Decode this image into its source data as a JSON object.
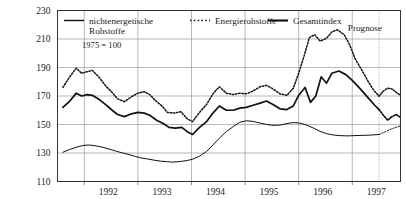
{
  "chart_data": {
    "type": "line",
    "title": "",
    "subtitle": "",
    "note": "1975 = 100",
    "xlabel": "",
    "ylabel": "",
    "ylim": [
      110,
      230
    ],
    "yticks": [
      110,
      130,
      150,
      170,
      190,
      210,
      230
    ],
    "xlim": [
      1991.5,
      1997.9
    ],
    "xticks": [
      1992,
      1993,
      1994,
      1995,
      1996,
      1997
    ],
    "xtick_labels": [
      "1992",
      "1993",
      "1994",
      "1995",
      "1996",
      "1997"
    ],
    "grid": true,
    "legend_position": "top",
    "forecast_label": "Prognose",
    "forecast_start_x": 1997.5,
    "legend": [
      {
        "label": "nichtenergetische Rohstoffe",
        "style": "solid-thin",
        "key": "nichtenergetische"
      },
      {
        "label": "Energierohstoffe",
        "style": "dotted",
        "key": "energie"
      },
      {
        "label": "Gesamtindex",
        "style": "solid-thick",
        "key": "gesamt"
      }
    ],
    "series": [
      {
        "name": "nichtenergetische Rohstoffe",
        "style": "solid-thin",
        "x": [
          1991.6,
          1991.75,
          1991.9,
          1992.0,
          1992.1,
          1992.22,
          1992.35,
          1992.48,
          1992.6,
          1992.72,
          1992.85,
          1992.95,
          1993.05,
          1993.18,
          1993.3,
          1993.42,
          1993.55,
          1993.65,
          1993.78,
          1993.9,
          1994.02,
          1994.15,
          1994.28,
          1994.4,
          1994.52,
          1994.65,
          1994.78,
          1994.9,
          1995.02,
          1995.15,
          1995.28,
          1995.4,
          1995.52,
          1995.65,
          1995.78,
          1995.9,
          1996.02,
          1996.15,
          1996.28,
          1996.4,
          1996.52,
          1996.65,
          1996.78,
          1996.9,
          1997.05,
          1997.2,
          1997.35,
          1997.5
        ],
        "y": [
          130.5,
          132.8,
          134.6,
          135.4,
          135.6,
          135.0,
          134.0,
          132.6,
          131.2,
          130.0,
          128.8,
          127.6,
          126.6,
          125.8,
          125.0,
          124.3,
          123.9,
          123.6,
          124.0,
          124.6,
          125.6,
          127.8,
          131.0,
          135.6,
          140.4,
          145.0,
          148.6,
          151.6,
          152.6,
          152.2,
          151.0,
          150.0,
          149.4,
          149.6,
          150.6,
          151.4,
          151.0,
          149.6,
          147.4,
          145.2,
          143.6,
          142.6,
          142.2,
          142.0,
          142.2,
          142.4,
          142.6,
          143.0
        ],
        "forecast_x": [
          1997.5,
          1997.6,
          1997.7,
          1997.8,
          1997.9
        ],
        "forecast_y": [
          143.0,
          144.6,
          146.4,
          147.8,
          149.0
        ]
      },
      {
        "name": "Energierohstoffe",
        "style": "dotted",
        "x": [
          1991.6,
          1991.72,
          1991.85,
          1991.95,
          1992.05,
          1992.15,
          1992.28,
          1992.4,
          1992.52,
          1992.62,
          1992.75,
          1992.88,
          1993.0,
          1993.12,
          1993.22,
          1993.32,
          1993.45,
          1993.55,
          1993.68,
          1993.8,
          1993.92,
          1994.02,
          1994.15,
          1994.28,
          1994.4,
          1994.52,
          1994.65,
          1994.78,
          1994.9,
          1995.02,
          1995.15,
          1995.28,
          1995.4,
          1995.52,
          1995.65,
          1995.78,
          1995.9,
          1996.0,
          1996.1,
          1996.2,
          1996.3,
          1996.4,
          1996.52,
          1996.62,
          1996.72,
          1996.85,
          1996.95,
          1997.05,
          1997.18,
          1997.3,
          1997.4,
          1997.5
        ],
        "y": [
          176.0,
          183.0,
          189.5,
          186.0,
          187.0,
          188.0,
          183.0,
          177.0,
          172.5,
          168.0,
          166.0,
          169.5,
          172.0,
          173.0,
          171.0,
          167.0,
          163.0,
          158.5,
          158.0,
          159.0,
          154.0,
          152.0,
          158.5,
          164.0,
          171.5,
          176.5,
          172.0,
          171.0,
          172.0,
          171.5,
          173.5,
          176.5,
          177.5,
          175.0,
          171.5,
          170.5,
          175.5,
          186.0,
          198.0,
          211.0,
          213.0,
          208.5,
          210.5,
          215.0,
          216.5,
          213.0,
          206.0,
          196.5,
          188.0,
          180.0,
          174.0,
          170.0
        ],
        "forecast_x": [
          1997.5,
          1997.58,
          1997.66,
          1997.74,
          1997.82,
          1997.9
        ],
        "forecast_y": [
          170.0,
          173.5,
          175.5,
          175.0,
          172.5,
          170.5
        ]
      },
      {
        "name": "Gesamtindex",
        "style": "solid-thick",
        "x": [
          1991.6,
          1991.72,
          1991.85,
          1991.95,
          1992.05,
          1992.15,
          1992.28,
          1992.4,
          1992.52,
          1992.62,
          1992.75,
          1992.88,
          1993.0,
          1993.12,
          1993.22,
          1993.35,
          1993.48,
          1993.58,
          1993.7,
          1993.82,
          1993.92,
          1994.02,
          1994.15,
          1994.28,
          1994.4,
          1994.52,
          1994.65,
          1994.78,
          1994.9,
          1995.02,
          1995.15,
          1995.28,
          1995.4,
          1995.52,
          1995.65,
          1995.78,
          1995.9,
          1996.0,
          1996.12,
          1996.22,
          1996.32,
          1996.42,
          1996.52,
          1996.62,
          1996.75,
          1996.88,
          1997.0,
          1997.15,
          1997.3,
          1997.42,
          1997.5
        ],
        "y": [
          162.0,
          166.0,
          172.0,
          170.0,
          171.0,
          170.5,
          167.5,
          164.0,
          160.0,
          157.0,
          155.5,
          157.5,
          158.5,
          158.0,
          156.5,
          153.0,
          150.5,
          148.0,
          147.5,
          148.0,
          145.0,
          143.0,
          148.0,
          152.0,
          158.0,
          163.0,
          160.0,
          160.0,
          161.5,
          162.0,
          163.5,
          165.0,
          166.5,
          164.0,
          161.0,
          160.5,
          163.0,
          170.5,
          176.0,
          165.5,
          170.0,
          183.5,
          179.0,
          186.0,
          187.5,
          185.0,
          181.0,
          175.0,
          168.5,
          163.5,
          160.5
        ],
        "forecast_x": [
          1997.5,
          1997.58,
          1997.66,
          1997.74,
          1997.82,
          1997.9
        ],
        "forecast_y": [
          160.5,
          156.5,
          153.0,
          155.5,
          157.0,
          155.0
        ]
      }
    ]
  }
}
